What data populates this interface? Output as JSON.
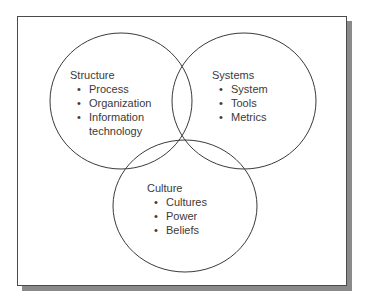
{
  "diagram": {
    "type": "venn",
    "colors": {
      "line": "#3a3a3a",
      "text": "#3a3a3a",
      "frame_border": "#4a4a4a",
      "frame_shadow": "#8a8a8a",
      "background": "#ffffff"
    },
    "bullet_glyph": "•",
    "circles": [
      {
        "id": "structure",
        "title": "Structure",
        "items": [
          "Process",
          "Organization",
          "Information technology"
        ]
      },
      {
        "id": "systems",
        "title": "Systems",
        "items": [
          "System",
          "Tools",
          "Metrics"
        ]
      },
      {
        "id": "culture",
        "title": "Culture",
        "items": [
          "Cultures",
          "Power",
          "Beliefs"
        ]
      }
    ]
  }
}
